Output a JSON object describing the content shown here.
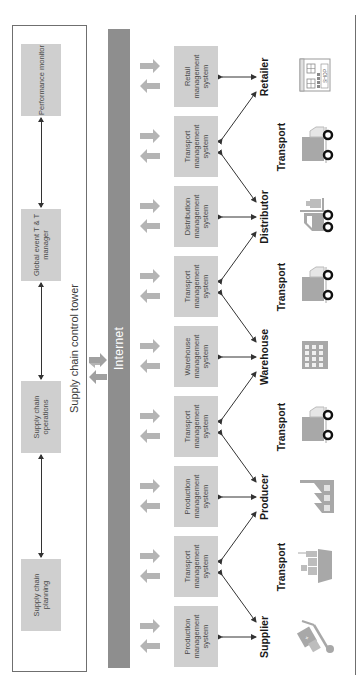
{
  "control_tower": {
    "title": "Supply chain control tower",
    "components": [
      {
        "label": "Supply chain planning"
      },
      {
        "label": "Supply chain operations"
      },
      {
        "label": "Global event T & T manager"
      },
      {
        "label": "Performance monitor"
      }
    ]
  },
  "internet": {
    "label": "Internet"
  },
  "systems": [
    {
      "label": "Production management system"
    },
    {
      "label": "Transport management system"
    },
    {
      "label": "Production management system"
    },
    {
      "label": "Transport management system"
    },
    {
      "label": "Warehouse management system"
    },
    {
      "label": "Transport management system"
    },
    {
      "label": "Distribution management system"
    },
    {
      "label": "Transport management system"
    },
    {
      "label": "Retail management system"
    }
  ],
  "entities": [
    {
      "label": "Supplier",
      "icon": "hand-truck-icon"
    },
    {
      "label": "Transport",
      "icon": "ship-icon"
    },
    {
      "label": "Producer",
      "icon": "factory-icon"
    },
    {
      "label": "Transport",
      "icon": "truck-icon"
    },
    {
      "label": "Warehouse",
      "icon": "warehouse-building-icon"
    },
    {
      "label": "Transport",
      "icon": "truck-icon"
    },
    {
      "label": "Distributor",
      "icon": "forklift-icon"
    },
    {
      "label": "Transport",
      "icon": "truck-icon"
    },
    {
      "label": "Retailer",
      "icon": "shop-icon"
    }
  ],
  "colors": {
    "box_fill": "#cfcfcf",
    "internet_bar": "#8e8e8e",
    "arrow_fill": "#b4b4b4",
    "icon_fill": "#a8a8a8"
  }
}
